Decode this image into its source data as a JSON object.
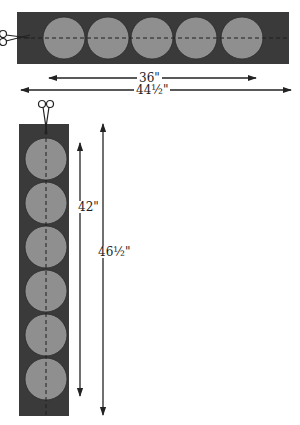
{
  "colors": {
    "strip": "#3a3a3a",
    "circle": "#8f8f8f",
    "line": "#222222"
  },
  "horizontal_strip": {
    "circle_count": 5,
    "inner_label": "36\"",
    "outer_label": "44½\""
  },
  "vertical_strip": {
    "circle_count": 6,
    "inner_label": "42\"",
    "outer_label": "46½\""
  },
  "icons": {
    "scissors_horizontal": "scissors-icon",
    "scissors_vertical": "scissors-icon"
  }
}
